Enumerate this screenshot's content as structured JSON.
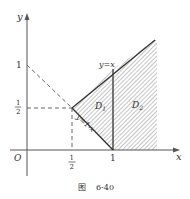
{
  "figure": {
    "caption_prefix": "图",
    "caption_number": "6-40"
  },
  "axes": {
    "x_label": "x",
    "y_label": "y",
    "origin_label": "O",
    "x_ticks": [
      {
        "value": "1/2",
        "num": "1",
        "den": "2"
      },
      {
        "value": "1",
        "label": "1"
      }
    ],
    "y_ticks": [
      {
        "value": "1/2",
        "num": "1",
        "den": "2"
      },
      {
        "value": "1",
        "label": "1"
      }
    ]
  },
  "lines": {
    "diag": "y=x",
    "anti": "y=1-x"
  },
  "regions": {
    "d1": {
      "name": "D",
      "sub": "1"
    },
    "d2": {
      "name": "D",
      "sub": "2"
    }
  },
  "colors": {
    "axis": "#555555",
    "line": "#333333",
    "hatch": "#888888",
    "dash": "#666666"
  }
}
